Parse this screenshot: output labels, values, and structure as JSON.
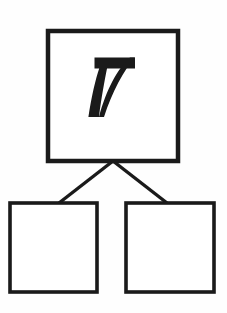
{
  "document": {
    "kind": "number-bond-worksheet",
    "title": "Number Bond",
    "canvas": {
      "width": 227,
      "height": 313
    },
    "background_color": "#fefefe",
    "ink_color": "#1a1a1a"
  },
  "number_bond": {
    "whole": {
      "label": "7",
      "value": 7,
      "filled": true,
      "box": {
        "x": 48,
        "y": 31,
        "width": 130,
        "height": 130,
        "stroke_width": 4.5
      }
    },
    "parts": [
      {
        "name": "part-left",
        "label": "",
        "value": null,
        "filled": false,
        "box": {
          "x": 10,
          "y": 203,
          "width": 87,
          "height": 89,
          "stroke_width": 3.6
        }
      },
      {
        "name": "part-right",
        "label": "",
        "value": null,
        "filled": false,
        "box": {
          "x": 126,
          "y": 203,
          "width": 88,
          "height": 89,
          "stroke_width": 3.6
        }
      }
    ],
    "connectors": [
      {
        "name": "connector-left",
        "from": [
          113,
          161
        ],
        "to": [
          59,
          203
        ],
        "stroke_width": 3.4
      },
      {
        "name": "connector-right",
        "from": [
          113,
          161
        ],
        "to": [
          167,
          203
        ],
        "stroke_width": 3.4
      }
    ]
  },
  "colors": {
    "ink": "#1a1a1a",
    "paper": "#fefefe",
    "box_fill": "#ffffff"
  }
}
